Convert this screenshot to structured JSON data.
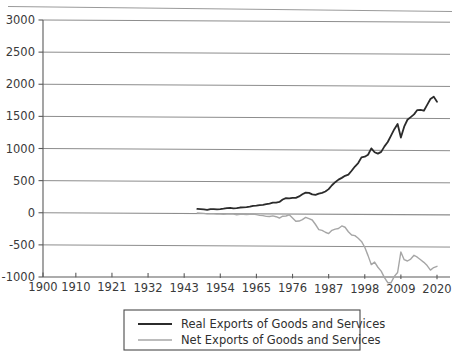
{
  "chart_data": {
    "type": "line",
    "title": "",
    "subtitle": "",
    "xlabel": "",
    "ylabel": "",
    "xlim": [
      1900,
      2020
    ],
    "ylim": [
      -1000,
      3000
    ],
    "grid": true,
    "legend_position": "bottom-center",
    "x_ticks": [
      "1900",
      "1910",
      "1921",
      "1932",
      "1943",
      "1954",
      "1965",
      "1976",
      "1987",
      "1998",
      "2009",
      "2020"
    ],
    "x_tick_values": [
      1900,
      1910,
      1921,
      1932,
      1943,
      1954,
      1965,
      1976,
      1987,
      1998,
      2009,
      2020
    ],
    "y_ticks": [
      "3000",
      "2500",
      "2000",
      "1500",
      "1000",
      "500",
      "0",
      "-500",
      "-1000"
    ],
    "y_tick_values": [
      3000,
      2500,
      2000,
      1500,
      1000,
      500,
      0,
      -500,
      -1000
    ],
    "series": [
      {
        "name": "Real Exports of Goods and Services",
        "color": "#2b2b2b",
        "width": 1.8,
        "x": [
          1947,
          1948,
          1949,
          1950,
          1951,
          1952,
          1953,
          1954,
          1955,
          1956,
          1957,
          1958,
          1959,
          1960,
          1961,
          1962,
          1963,
          1964,
          1965,
          1966,
          1967,
          1968,
          1969,
          1970,
          1971,
          1972,
          1973,
          1974,
          1975,
          1976,
          1977,
          1978,
          1979,
          1980,
          1981,
          1982,
          1983,
          1984,
          1985,
          1986,
          1987,
          1988,
          1989,
          1990,
          1991,
          1992,
          1993,
          1994,
          1995,
          1996,
          1997,
          1998,
          1999,
          2000,
          2001,
          2002,
          2003,
          2004,
          2005,
          2006,
          2007,
          2008,
          2009,
          2010,
          2011,
          2012,
          2013,
          2014,
          2015,
          2016,
          2017,
          2018,
          2019,
          2020
        ],
        "values": [
          72,
          70,
          66,
          60,
          72,
          70,
          66,
          70,
          78,
          88,
          92,
          84,
          88,
          98,
          100,
          104,
          112,
          126,
          128,
          138,
          142,
          152,
          160,
          176,
          178,
          188,
          226,
          248,
          244,
          252,
          252,
          276,
          310,
          336,
          332,
          308,
          300,
          320,
          332,
          354,
          392,
          452,
          500,
          540,
          568,
          600,
          620,
          680,
          746,
          800,
          888,
          900,
          930,
          1030,
          970,
          948,
          976,
          1062,
          1130,
          1230,
          1330,
          1410,
          1200,
          1370,
          1478,
          1520,
          1562,
          1630,
          1632,
          1620,
          1712,
          1804,
          1840,
          1760
        ],
        "final_value": 2500
      },
      {
        "name": "Net Exports of Goods and Services",
        "color": "#a6a6a6",
        "width": 1.4,
        "x": [
          1947,
          1948,
          1949,
          1950,
          1951,
          1952,
          1953,
          1954,
          1955,
          1956,
          1957,
          1958,
          1959,
          1960,
          1961,
          1962,
          1963,
          1964,
          1965,
          1966,
          1967,
          1968,
          1969,
          1970,
          1971,
          1972,
          1973,
          1974,
          1975,
          1976,
          1977,
          1978,
          1979,
          1980,
          1981,
          1982,
          1983,
          1984,
          1985,
          1986,
          1987,
          1988,
          1989,
          1990,
          1991,
          1992,
          1993,
          1994,
          1995,
          1996,
          1997,
          1998,
          1999,
          2000,
          2001,
          2002,
          2003,
          2004,
          2005,
          2006,
          2007,
          2008,
          2009,
          2010,
          2011,
          2012,
          2013,
          2014,
          2015,
          2016,
          2017,
          2018,
          2019,
          2020
        ],
        "values": [
          8,
          6,
          4,
          -4,
          0,
          -2,
          -6,
          -4,
          -8,
          -4,
          0,
          -6,
          -14,
          -8,
          -6,
          -10,
          -8,
          -2,
          -12,
          -22,
          -26,
          -38,
          -40,
          -30,
          -42,
          -62,
          -34,
          -30,
          -12,
          -62,
          -110,
          -108,
          -86,
          -50,
          -70,
          -90,
          -160,
          -240,
          -250,
          -280,
          -300,
          -250,
          -230,
          -220,
          -180,
          -200,
          -270,
          -320,
          -330,
          -370,
          -420,
          -510,
          -640,
          -780,
          -740,
          -820,
          -880,
          -980,
          -1060,
          -1060,
          -960,
          -900,
          -580,
          -700,
          -720,
          -690,
          -630,
          -660,
          -700,
          -740,
          -790,
          -860,
          -820,
          -800
        ],
        "scale_note": "plotted values are in chart units",
        "final_value": -650
      }
    ],
    "legend": [
      {
        "label": "Real Exports of Goods and Services",
        "color": "#2b2b2b",
        "width": 1.9
      },
      {
        "label": "Net Exports of Goods and Services",
        "color": "#a6a6a6",
        "width": 1.4
      }
    ]
  }
}
